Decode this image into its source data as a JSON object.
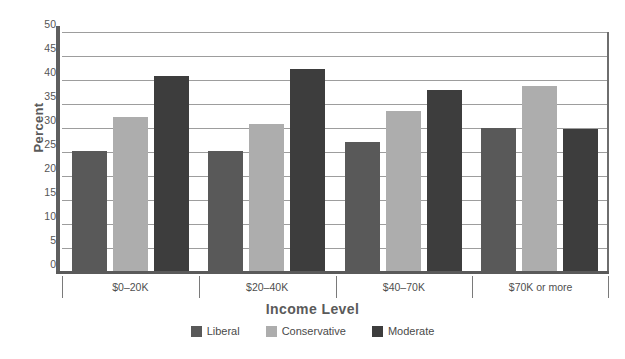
{
  "chart_data": {
    "type": "bar",
    "title": "",
    "xlabel": "Income Level",
    "ylabel": "Percent",
    "categories": [
      "$0–20K",
      "$20–40K",
      "$40–70K",
      "$70K or more"
    ],
    "series": [
      {
        "name": "Liberal",
        "color": "#595959",
        "values": [
          25.3,
          25.2,
          27.1,
          30.0
        ]
      },
      {
        "name": "Conservative",
        "color": "#adadad",
        "values": [
          32.3,
          30.8,
          33.5,
          38.8
        ]
      },
      {
        "name": "Moderate",
        "color": "#3d3d3d",
        "values": [
          40.8,
          42.2,
          38.0,
          29.8
        ]
      }
    ],
    "ylim": [
      0,
      50
    ],
    "ytick_step": 5,
    "yticks": [
      0,
      5,
      10,
      15,
      20,
      25,
      30,
      35,
      40,
      45,
      50
    ],
    "grid": true,
    "grid_axis": "y",
    "legend_position": "bottom"
  },
  "axes": {
    "y_title": "Percent",
    "x_title": "Income Level"
  },
  "colors": {
    "liberal": "#595959",
    "conservative": "#adadad",
    "moderate": "#3d3d3d",
    "grid": "#9d9d9d",
    "axis": "#5a5a5a",
    "background": "#ffffff"
  }
}
